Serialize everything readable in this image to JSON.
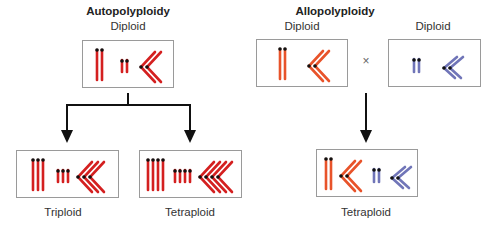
{
  "colors": {
    "red": "#d42020",
    "orange": "#e8532a",
    "blue": "#7075b8",
    "centromere": "#111111",
    "box_border": "#9a9a9a",
    "arrow": "#111111"
  },
  "autopolyploidy": {
    "title": "Autopolyploidy",
    "parent": {
      "label": "Diploid",
      "sets": 2
    },
    "children": [
      {
        "label": "Triploid",
        "sets": 3
      },
      {
        "label": "Tetraploid",
        "sets": 4
      }
    ]
  },
  "allopolyploidy": {
    "title": "Allopolyploidy",
    "parents": [
      {
        "label": "Diploid",
        "species": "orange-species",
        "sets": 2
      },
      {
        "label": "Diploid",
        "species": "blue-species",
        "sets": 2
      }
    ],
    "cross_symbol": "×",
    "child": {
      "label": "Tetraploid",
      "sets": "2 + 2"
    }
  }
}
